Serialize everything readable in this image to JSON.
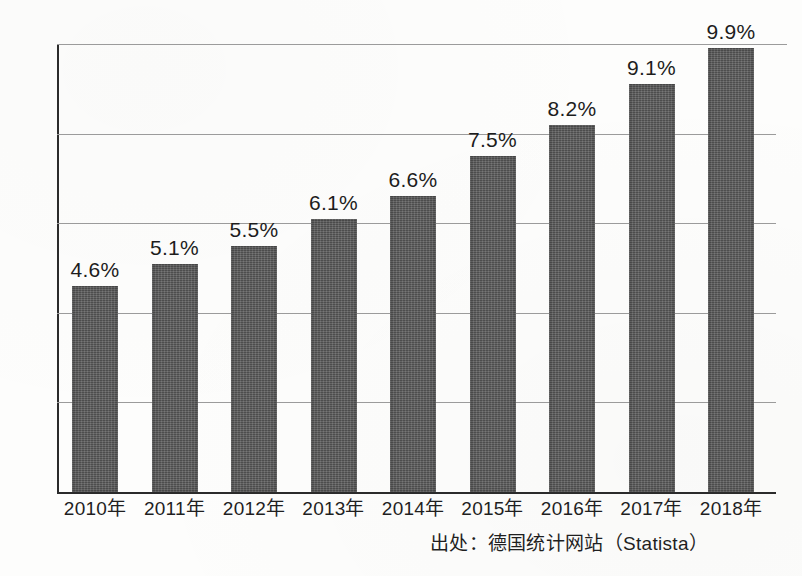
{
  "chart_data": {
    "type": "bar",
    "title": "",
    "subtitle": "",
    "xlabel": "",
    "ylabel": "",
    "categories": [
      "2010年",
      "2011年",
      "2012年",
      "2013年",
      "2014年",
      "2015年",
      "2016年",
      "2017年",
      "2018年"
    ],
    "values": [
      4.6,
      5.1,
      5.5,
      6.1,
      6.6,
      7.5,
      8.2,
      9.1,
      9.9
    ],
    "value_labels": [
      "4.6%",
      "5.1%",
      "5.5%",
      "6.1%",
      "6.6%",
      "7.5%",
      "8.2%",
      "9.1%",
      "9.9%"
    ],
    "ylim": [
      0,
      10
    ],
    "ytick_values": [
      0,
      2,
      4,
      6,
      8,
      10
    ],
    "ytick_labels": [
      "0",
      "2",
      "4",
      "6",
      "8",
      "10"
    ],
    "grid": true,
    "grid_axis": "y",
    "legend": false,
    "legend_position": "none",
    "bar_color": "#585858",
    "gridline_color": "#9b9b9b",
    "axis_color": "#2b2b2b",
    "text_color": "#1d1d1d"
  },
  "annotations": {
    "source_note": "出处：德国统计网站（Statista）"
  }
}
